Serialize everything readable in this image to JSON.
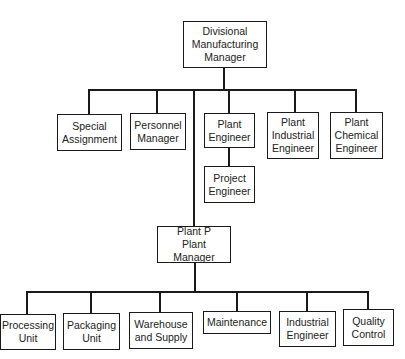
{
  "diagram": {
    "type": "organization-chart",
    "root": {
      "label": "Divisional\nManufacturing\nManager"
    },
    "division_staff": [
      {
        "label": "Special\nAssignment"
      },
      {
        "label": "Personnel\nManager"
      },
      {
        "label": "Plant\nEngineer"
      },
      {
        "label": "Plant\nIndustrial\nEngineer"
      },
      {
        "label": "Plant\nChemical\nEngineer"
      }
    ],
    "plant_engineer_report": {
      "label": "Project\nEngineer"
    },
    "plant_manager": {
      "label": "Plant P\nPlant Manager"
    },
    "plant_units": [
      {
        "label": "Processing\nUnit"
      },
      {
        "label": "Packaging\nUnit"
      },
      {
        "label": "Warehouse\nand Supply"
      },
      {
        "label": "Maintenance"
      },
      {
        "label": "Industrial\nEngineer"
      },
      {
        "label": "Quality\nControl"
      }
    ],
    "colors": {
      "line": "#1a1a1a",
      "box_border": "#1a1a1a",
      "box_fill": "#ffffff",
      "text": "#222222"
    }
  }
}
